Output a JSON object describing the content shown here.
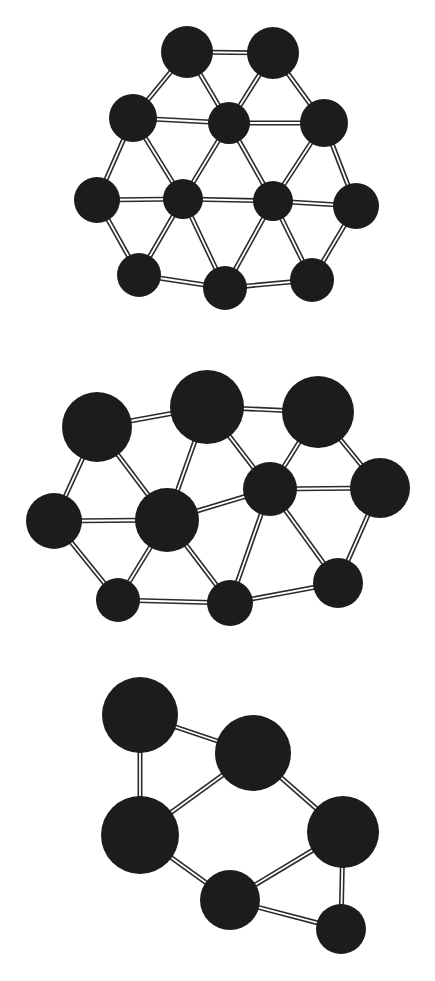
{
  "figure": {
    "width": 435,
    "height": 981,
    "background": "#ffffff",
    "atom_color": "#1c1c1c",
    "bond_color": "#2a2a2a",
    "bond_outer_width": 5,
    "bond_inner_width": 1.8
  },
  "structures": [
    {
      "id": "cluster-top",
      "label": "planar triangular cluster (12 atoms)",
      "atoms": [
        {
          "id": "A1",
          "x": 187,
          "y": 52,
          "r": 26
        },
        {
          "id": "A2",
          "x": 273,
          "y": 53,
          "r": 26
        },
        {
          "id": "B1",
          "x": 133,
          "y": 118,
          "r": 24
        },
        {
          "id": "B2",
          "x": 229,
          "y": 123,
          "r": 21
        },
        {
          "id": "B3",
          "x": 324,
          "y": 123,
          "r": 24
        },
        {
          "id": "C1",
          "x": 97,
          "y": 200,
          "r": 23
        },
        {
          "id": "C2",
          "x": 183,
          "y": 199,
          "r": 20
        },
        {
          "id": "C3",
          "x": 273,
          "y": 201,
          "r": 20
        },
        {
          "id": "C4",
          "x": 356,
          "y": 206,
          "r": 23
        },
        {
          "id": "D1",
          "x": 139,
          "y": 275,
          "r": 22
        },
        {
          "id": "D2",
          "x": 225,
          "y": 288,
          "r": 22
        },
        {
          "id": "D3",
          "x": 312,
          "y": 280,
          "r": 22
        }
      ],
      "bonds": [
        [
          "A1",
          "A2"
        ],
        [
          "A1",
          "B1"
        ],
        [
          "A1",
          "B2"
        ],
        [
          "A2",
          "B2"
        ],
        [
          "A2",
          "B3"
        ],
        [
          "B1",
          "B2"
        ],
        [
          "B2",
          "B3"
        ],
        [
          "B1",
          "C1"
        ],
        [
          "B1",
          "C2"
        ],
        [
          "B2",
          "C2"
        ],
        [
          "B2",
          "C3"
        ],
        [
          "B3",
          "C3"
        ],
        [
          "B3",
          "C4"
        ],
        [
          "C1",
          "C2"
        ],
        [
          "C2",
          "C3"
        ],
        [
          "C3",
          "C4"
        ],
        [
          "C1",
          "D1"
        ],
        [
          "C2",
          "D1"
        ],
        [
          "C2",
          "D2"
        ],
        [
          "C3",
          "D2"
        ],
        [
          "C3",
          "D3"
        ],
        [
          "C4",
          "D3"
        ],
        [
          "D1",
          "D2"
        ],
        [
          "D2",
          "D3"
        ]
      ]
    },
    {
      "id": "cluster-middle",
      "label": "distorted planar cluster (10 atoms)",
      "atoms": [
        {
          "id": "M1",
          "x": 97,
          "y": 427,
          "r": 35
        },
        {
          "id": "M2",
          "x": 207,
          "y": 407,
          "r": 37
        },
        {
          "id": "M3",
          "x": 318,
          "y": 412,
          "r": 36
        },
        {
          "id": "M4",
          "x": 380,
          "y": 488,
          "r": 30
        },
        {
          "id": "M5",
          "x": 270,
          "y": 489,
          "r": 27
        },
        {
          "id": "M6",
          "x": 167,
          "y": 520,
          "r": 32
        },
        {
          "id": "M7",
          "x": 54,
          "y": 521,
          "r": 28
        },
        {
          "id": "M8",
          "x": 118,
          "y": 600,
          "r": 22
        },
        {
          "id": "M9",
          "x": 230,
          "y": 603,
          "r": 23
        },
        {
          "id": "M10",
          "x": 338,
          "y": 583,
          "r": 25
        }
      ],
      "bonds": [
        [
          "M1",
          "M2"
        ],
        [
          "M2",
          "M3"
        ],
        [
          "M1",
          "M7"
        ],
        [
          "M1",
          "M6"
        ],
        [
          "M2",
          "M6"
        ],
        [
          "M2",
          "M5"
        ],
        [
          "M3",
          "M5"
        ],
        [
          "M3",
          "M4"
        ],
        [
          "M5",
          "M4"
        ],
        [
          "M6",
          "M5"
        ],
        [
          "M7",
          "M6"
        ],
        [
          "M7",
          "M8"
        ],
        [
          "M6",
          "M8"
        ],
        [
          "M6",
          "M9"
        ],
        [
          "M5",
          "M9"
        ],
        [
          "M5",
          "M10"
        ],
        [
          "M4",
          "M10"
        ],
        [
          "M8",
          "M9"
        ],
        [
          "M9",
          "M10"
        ]
      ]
    },
    {
      "id": "cluster-bottom",
      "label": "small ring cluster (6 atoms)",
      "atoms": [
        {
          "id": "L1",
          "x": 140,
          "y": 715,
          "r": 38
        },
        {
          "id": "L2",
          "x": 253,
          "y": 753,
          "r": 38
        },
        {
          "id": "L3",
          "x": 140,
          "y": 835,
          "r": 39
        },
        {
          "id": "L4",
          "x": 343,
          "y": 832,
          "r": 36
        },
        {
          "id": "L5",
          "x": 230,
          "y": 900,
          "r": 30
        },
        {
          "id": "L6",
          "x": 341,
          "y": 929,
          "r": 25
        }
      ],
      "bonds": [
        [
          "L1",
          "L2"
        ],
        [
          "L1",
          "L3"
        ],
        [
          "L2",
          "L3"
        ],
        [
          "L2",
          "L4"
        ],
        [
          "L3",
          "L5"
        ],
        [
          "L5",
          "L4"
        ],
        [
          "L4",
          "L6"
        ],
        [
          "L5",
          "L6"
        ]
      ]
    }
  ]
}
